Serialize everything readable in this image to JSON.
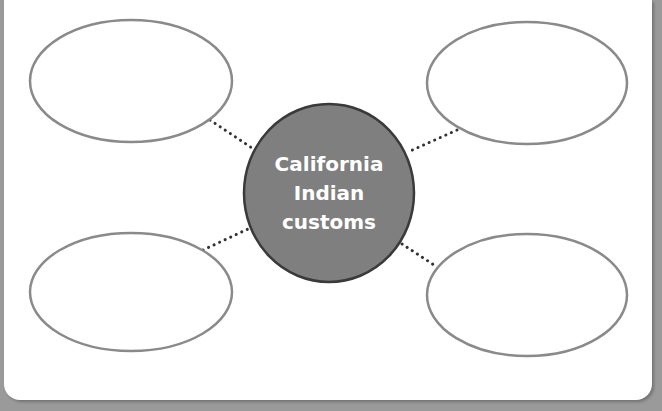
{
  "diagram": {
    "type": "concept-web",
    "center": {
      "lines": [
        "California",
        "Indian",
        "customs"
      ],
      "fill": "#7f7f7f",
      "stroke": "#3a3a3a"
    },
    "outer_bubbles": [
      {
        "position": "top-left",
        "text": ""
      },
      {
        "position": "top-right",
        "text": ""
      },
      {
        "position": "bottom-left",
        "text": ""
      },
      {
        "position": "bottom-right",
        "text": ""
      }
    ],
    "colors": {
      "bubble_stroke": "#8a8a8a",
      "connector": "#333333",
      "frame": "#9a9a9a",
      "background": "#ffffff"
    }
  }
}
